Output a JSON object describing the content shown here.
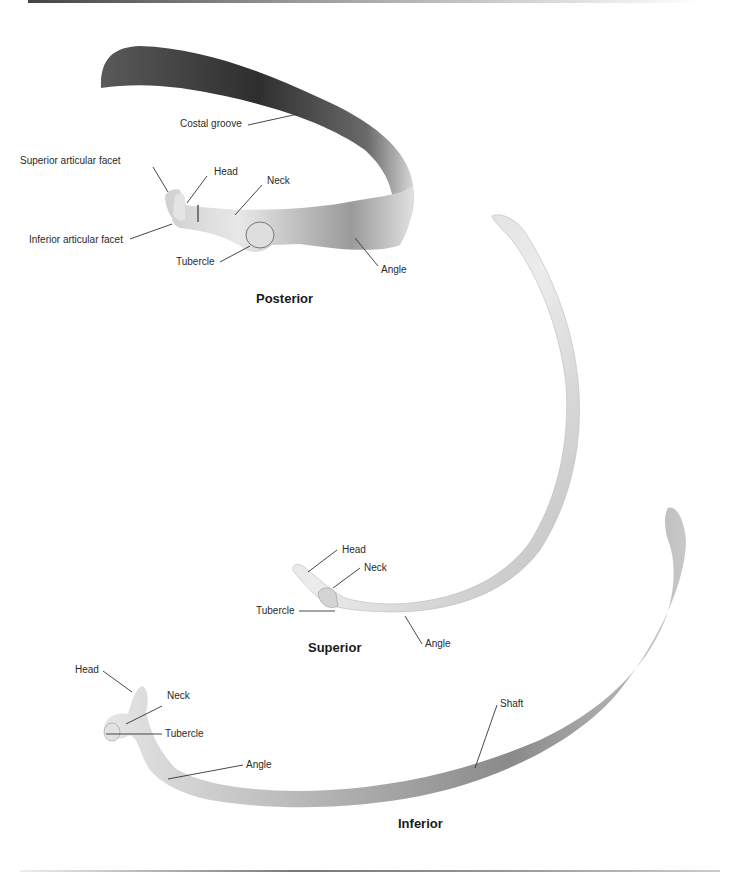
{
  "figure": {
    "views": [
      {
        "id": "posterior",
        "title": "Posterior",
        "labels": [
          "Costal groove",
          "Superior articular facet",
          "Head",
          "Neck",
          "Inferior articular facet",
          "Tubercle",
          "Angle"
        ]
      },
      {
        "id": "superior",
        "title": "Superior",
        "labels": [
          "Head",
          "Neck",
          "Tubercle",
          "Angle"
        ]
      },
      {
        "id": "inferior",
        "title": "Inferior",
        "labels": [
          "Head",
          "Neck",
          "Tubercle",
          "Angle",
          "Shaft"
        ]
      }
    ],
    "colors": {
      "background": "#ffffff",
      "label_text": "#2a2a2a",
      "leader_line": "#333333",
      "bone_dark": "#3a3a3a",
      "bone_light": "#f2f2f2"
    }
  }
}
